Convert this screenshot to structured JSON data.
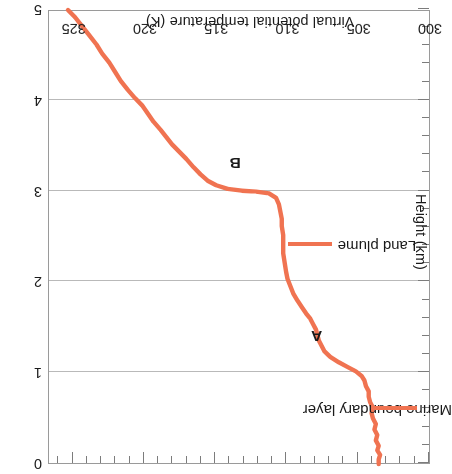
{
  "chart_data": {
    "type": "line",
    "title": "",
    "xlabel": "Virtual potential temperature (K)",
    "ylabel": "Height (km)",
    "xlim": [
      300,
      326.8
    ],
    "ylim": [
      0,
      5
    ],
    "y_inverted": false,
    "orientation": "rotated-180",
    "grid": "horizontal gridlines at each labelled height",
    "legend_position": "none",
    "xticks": [
      300,
      305,
      310,
      315,
      320,
      325
    ],
    "xtick_labels": [
      "300",
      "305",
      "310",
      "315",
      "320",
      "325"
    ],
    "xminor_step": 1,
    "yticks": [
      0,
      1,
      2,
      3,
      4,
      5
    ],
    "ytick_labels": [
      "0",
      "1",
      "2",
      "3",
      "4",
      "5"
    ],
    "yminor_step": 0.2,
    "series": [
      {
        "name": "Virtual potential temperature sounding",
        "color": "#F07351",
        "x_label": "Virtual potential temperature (K)",
        "y_label": "Height (km)",
        "points": [
          [
            303.6,
            0.0
          ],
          [
            303.6,
            0.05
          ],
          [
            303.5,
            0.1
          ],
          [
            303.7,
            0.15
          ],
          [
            303.6,
            0.2
          ],
          [
            303.8,
            0.26
          ],
          [
            303.7,
            0.32
          ],
          [
            303.9,
            0.38
          ],
          [
            303.8,
            0.44
          ],
          [
            304.0,
            0.5
          ],
          [
            304.1,
            0.56
          ],
          [
            304.0,
            0.62
          ],
          [
            304.2,
            0.68
          ],
          [
            304.3,
            0.74
          ],
          [
            304.3,
            0.8
          ],
          [
            304.5,
            0.86
          ],
          [
            304.6,
            0.92
          ],
          [
            304.8,
            0.97
          ],
          [
            305.2,
            1.02
          ],
          [
            305.8,
            1.07
          ],
          [
            306.4,
            1.12
          ],
          [
            307.0,
            1.18
          ],
          [
            307.4,
            1.24
          ],
          [
            307.6,
            1.3
          ],
          [
            307.8,
            1.36
          ],
          [
            307.9,
            1.42
          ],
          [
            308.0,
            1.48
          ],
          [
            308.2,
            1.54
          ],
          [
            308.4,
            1.6
          ],
          [
            308.7,
            1.66
          ],
          [
            309.0,
            1.73
          ],
          [
            309.3,
            1.8
          ],
          [
            309.6,
            1.88
          ],
          [
            309.8,
            1.96
          ],
          [
            310.0,
            2.04
          ],
          [
            310.1,
            2.12
          ],
          [
            310.2,
            2.22
          ],
          [
            310.3,
            2.32
          ],
          [
            310.3,
            2.42
          ],
          [
            310.3,
            2.52
          ],
          [
            310.4,
            2.62
          ],
          [
            310.4,
            2.7
          ],
          [
            310.5,
            2.78
          ],
          [
            310.6,
            2.86
          ],
          [
            310.8,
            2.93
          ],
          [
            311.3,
            2.98
          ],
          [
            312.2,
            3.0
          ],
          [
            313.2,
            3.01
          ],
          [
            314.2,
            3.03
          ],
          [
            315.0,
            3.07
          ],
          [
            315.6,
            3.12
          ],
          [
            316.1,
            3.19
          ],
          [
            316.6,
            3.27
          ],
          [
            317.1,
            3.36
          ],
          [
            317.6,
            3.44
          ],
          [
            318.1,
            3.52
          ],
          [
            318.5,
            3.6
          ],
          [
            318.9,
            3.68
          ],
          [
            319.4,
            3.77
          ],
          [
            319.8,
            3.86
          ],
          [
            320.2,
            3.95
          ],
          [
            320.7,
            4.03
          ],
          [
            321.2,
            4.12
          ],
          [
            321.7,
            4.22
          ],
          [
            322.1,
            4.32
          ],
          [
            322.5,
            4.42
          ],
          [
            323.0,
            4.52
          ],
          [
            323.4,
            4.62
          ],
          [
            323.9,
            4.72
          ],
          [
            324.4,
            4.82
          ],
          [
            324.9,
            4.92
          ],
          [
            325.4,
            5.0
          ]
        ]
      }
    ],
    "annotations": [
      {
        "text": "Marine boundary layer",
        "points_to_x": 304.4,
        "points_to_y": 0.62,
        "leader": true
      },
      {
        "text": "Land plume",
        "points_to_x": 310.4,
        "points_to_y": 2.42,
        "leader": true
      },
      {
        "text": "A",
        "points_to_x": 305.6,
        "points_to_y": 1.05,
        "leader": false
      },
      {
        "text": "B",
        "points_to_x": 311.6,
        "points_to_y": 3.0,
        "leader": false
      }
    ]
  },
  "axes": {
    "x_title": "Virtual potential temperature (K)",
    "y_title": "Height (km)",
    "x_tick_labels": [
      "300",
      "305",
      "310",
      "315",
      "320",
      "325"
    ],
    "y_tick_labels": [
      "0",
      "1",
      "2",
      "3",
      "4",
      "5"
    ]
  },
  "annotations": {
    "marine_boundary_layer": "Marine boundary layer",
    "land_plume": "Land plume",
    "point_a": "A",
    "point_b": "B"
  },
  "colors": {
    "curve": "#F07351",
    "frame": "#9A9A9A",
    "gridline": "#B9B9B9",
    "text": "#1A1A1A",
    "background": "#FFFFFF"
  }
}
